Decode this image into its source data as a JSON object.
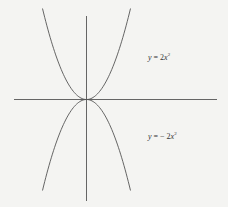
{
  "chart_data": {
    "type": "line",
    "title": "",
    "xlabel": "",
    "ylabel": "",
    "grid": false,
    "legend": "none",
    "axis_ticks": "none",
    "series": [
      {
        "name": "y = 2x²",
        "equation": "y = 2x^2",
        "label_position": "upper-right"
      },
      {
        "name": "y = −2x²",
        "equation": "y = -2x^2",
        "label_position": "lower-right"
      }
    ],
    "annotations": [
      {
        "text": "y = 2x²",
        "position": "right of upper parabola"
      },
      {
        "text": "y = − 2x²",
        "position": "right of lower parabola"
      }
    ]
  },
  "labels": {
    "upper": {
      "var": "y",
      "eq": " = 2",
      "x": "x",
      "exp": "2"
    },
    "lower": {
      "var": "y",
      "eq": " = − 2",
      "x": "x",
      "exp": "2"
    }
  },
  "colors": {
    "background": "#f4f4f2",
    "stroke": "#555555"
  }
}
